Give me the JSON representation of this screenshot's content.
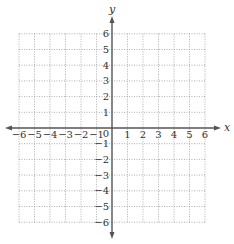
{
  "chart_data": {
    "type": "coordinate-grid",
    "title": "",
    "xlabel": "x",
    "ylabel": "y",
    "xlim": [
      -6,
      6
    ],
    "ylim": [
      -6,
      6
    ],
    "grid": true,
    "grid_style": "dotted",
    "x_ticks": [
      -6,
      -5,
      -4,
      -3,
      -2,
      -1,
      1,
      2,
      3,
      4,
      5,
      6
    ],
    "y_ticks": [
      6,
      5,
      4,
      3,
      2,
      1,
      -1,
      -2,
      -3,
      -4,
      -5,
      -6
    ],
    "origin_label": "0",
    "series": []
  },
  "labels": {
    "x_axis": "x",
    "y_axis": "y",
    "origin": "0",
    "x_tick_labels": [
      "−6",
      "−5",
      "−4",
      "−3",
      "−2",
      "−1",
      "1",
      "2",
      "3",
      "4",
      "5",
      "6"
    ],
    "y_tick_labels": [
      "6",
      "5",
      "4",
      "3",
      "2",
      "1",
      "−1",
      "−2",
      "−3",
      "−4",
      "−5",
      "−6"
    ]
  },
  "colors": {
    "axis": "#555555",
    "grid": "#9a9a9a",
    "text": "#333333"
  }
}
